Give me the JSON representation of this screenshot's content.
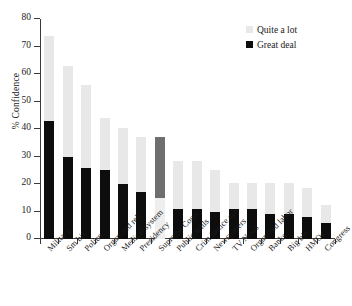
{
  "chart_data": {
    "type": "bar",
    "stacked": true,
    "title": "",
    "xlabel": "",
    "ylabel": "% Confidence",
    "ylim": [
      0,
      80
    ],
    "yticks": [
      0,
      10,
      20,
      30,
      40,
      50,
      60,
      70,
      80
    ],
    "grid": false,
    "legend_position": "top-right",
    "categories": [
      "Military",
      "Sm biz",
      "Police",
      "Organized reli",
      "Medical system",
      "Presidency",
      "Supreme Court",
      "Public schls",
      "Crim justice sys",
      "Newspapers",
      "TV News",
      "Organized labor",
      "Banks",
      "Big biz",
      "HMOs",
      "Congress"
    ],
    "series": [
      {
        "name": "Great deal",
        "color": "#0d0d0d",
        "values": [
          43,
          30,
          26,
          25,
          20,
          17,
          15,
          11,
          11,
          10,
          11,
          11,
          9,
          9,
          8,
          6
        ]
      },
      {
        "name": "Quite a lot",
        "color": "#e8e8e8",
        "values": [
          31,
          33,
          30,
          19,
          20.5,
          20,
          22,
          17.5,
          17.5,
          15,
          9.5,
          9.5,
          11.5,
          11.5,
          10.5,
          6.5
        ]
      }
    ],
    "totals": [
      74,
      63,
      56,
      44,
      40.5,
      37,
      37,
      28.5,
      28.5,
      25,
      20.5,
      20.5,
      20.5,
      20.5,
      18.5,
      12.5
    ],
    "annotations": [
      {
        "category": "Supreme Court",
        "note": "bar rendered with dark-grey upper segment and pale lower segment (shading inverted relative to other bars)",
        "upper_color": "#6e6e6e",
        "lower_color": "#eeeeee"
      }
    ]
  },
  "legend": {
    "items": [
      {
        "label": "Quite a lot",
        "color": "#e8e8e8"
      },
      {
        "label": "Great deal",
        "color": "#0d0d0d"
      }
    ]
  },
  "axis": {
    "y_title": "% Confidence"
  }
}
